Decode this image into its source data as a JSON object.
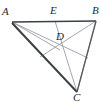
{
  "figure": {
    "kind": "geometry-diagram",
    "background_color": "#ffffff",
    "outline_color": "#3c3f44",
    "cevian_color": "#9a9da3",
    "label_color": "#25282b"
  },
  "points": {
    "A": {
      "label": "A",
      "x": 12,
      "y": 22,
      "label_x": 2,
      "label_y": 6
    },
    "B": {
      "label": "B",
      "x": 96,
      "y": 21,
      "label_x": 92,
      "label_y": 5
    },
    "C": {
      "label": "C",
      "x": 77,
      "y": 92,
      "label_x": 73,
      "label_y": 92
    },
    "D": {
      "label": "D",
      "x": 60,
      "y": 50,
      "label_x": 56,
      "label_y": 31
    },
    "E": {
      "label": "E",
      "x": 55,
      "y": 21,
      "label_x": 50,
      "label_y": 5
    },
    "F": {
      "label": "",
      "x": 40,
      "y": 57,
      "label_x": 0,
      "label_y": 0
    },
    "G": {
      "label": "",
      "x": 88,
      "y": 58,
      "label_x": 0,
      "label_y": 0
    }
  },
  "segments": {
    "sides": [
      {
        "name": "side-AB",
        "from": "A",
        "to": "B"
      },
      {
        "name": "side-BC",
        "from": "B",
        "to": "C"
      },
      {
        "name": "side-CA",
        "from": "C",
        "to": "A"
      }
    ],
    "cevians": [
      {
        "name": "cevian-C-to-E",
        "from": "C",
        "to": "E"
      },
      {
        "name": "cevian-A-to-G",
        "from": "A",
        "to": "G"
      },
      {
        "name": "cevian-B-to-F",
        "from": "B",
        "to": "F"
      },
      {
        "name": "cevian-A-to-D-extended",
        "from": "A",
        "to": "B"
      }
    ]
  }
}
